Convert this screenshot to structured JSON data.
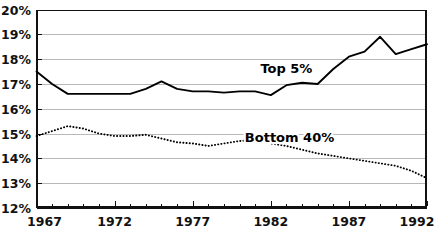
{
  "chart_data": {
    "type": "line",
    "title": "",
    "subtitle": "",
    "xlabel": "",
    "ylabel": "",
    "xlim": [
      1967,
      1992
    ],
    "ylim": [
      12,
      20
    ],
    "grid": true,
    "grid_axis": "y",
    "legend_position": "inline-annotation",
    "x": [
      1967,
      1968,
      1969,
      1970,
      1971,
      1972,
      1973,
      1974,
      1975,
      1976,
      1977,
      1978,
      1979,
      1980,
      1981,
      1982,
      1983,
      1984,
      1985,
      1986,
      1987,
      1988,
      1989,
      1990,
      1991,
      1992
    ],
    "xticks": [
      1967,
      1972,
      1977,
      1982,
      1987,
      1992
    ],
    "xtick_labels": [
      "1967",
      "1972",
      "1977",
      "1982",
      "1987",
      "1992"
    ],
    "yticks": [
      12,
      13,
      14,
      15,
      16,
      17,
      18,
      19,
      20
    ],
    "ytick_labels": [
      "12%",
      "13%",
      "14%",
      "15%",
      "16%",
      "17%",
      "18%",
      "19%",
      "20%"
    ],
    "series": [
      {
        "name": "Top 5%",
        "style": "solid",
        "color": "#000000",
        "label_text": "Top 5%",
        "label_x": 1983.0,
        "label_y": 17.45,
        "values": [
          17.5,
          17.0,
          16.6,
          16.6,
          16.6,
          16.6,
          16.6,
          16.8,
          17.1,
          16.8,
          16.7,
          16.7,
          16.65,
          16.7,
          16.7,
          16.55,
          16.95,
          17.05,
          17.0,
          17.6,
          18.1,
          18.3,
          18.9,
          18.2,
          18.4,
          18.6
        ]
      },
      {
        "name": "Bottom 40%",
        "style": "dotted",
        "color": "#000000",
        "label_text": "Bottom 40%",
        "label_x": 1983.2,
        "label_y": 14.65,
        "values": [
          14.9,
          15.1,
          15.3,
          15.2,
          15.0,
          14.9,
          14.9,
          14.95,
          14.8,
          14.65,
          14.6,
          14.5,
          14.6,
          14.7,
          14.75,
          14.6,
          14.5,
          14.35,
          14.2,
          14.1,
          14.0,
          13.9,
          13.8,
          13.7,
          13.5,
          13.2
        ]
      }
    ]
  },
  "axes": {
    "y_axis_name": "percent-share",
    "x_axis_name": "year"
  }
}
